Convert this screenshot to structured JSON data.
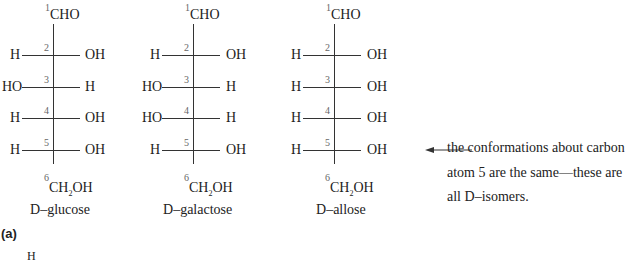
{
  "figure": {
    "panel_label": "(a)",
    "partial_next_label": "H",
    "structures": [
      {
        "name_prefix": "D",
        "name_suffix": "–glucose",
        "top": "CHO",
        "bottom_pre": "CH",
        "bottom_sub": "2",
        "bottom_post": "OH",
        "carbons": [
          {
            "num": "1"
          },
          {
            "num": "2",
            "left": "H",
            "right": "OH"
          },
          {
            "num": "3",
            "left": "HO",
            "right": "H"
          },
          {
            "num": "4",
            "left": "H",
            "right": "OH"
          },
          {
            "num": "5",
            "left": "H",
            "right": "OH"
          },
          {
            "num": "6"
          }
        ]
      },
      {
        "name_prefix": "D",
        "name_suffix": "–galactose",
        "top": "CHO",
        "bottom_pre": "CH",
        "bottom_sub": "2",
        "bottom_post": "OH",
        "carbons": [
          {
            "num": "1"
          },
          {
            "num": "2",
            "left": "H",
            "right": "OH"
          },
          {
            "num": "3",
            "left": "HO",
            "right": "H"
          },
          {
            "num": "4",
            "left": "HO",
            "right": "H"
          },
          {
            "num": "5",
            "left": "H",
            "right": "OH"
          },
          {
            "num": "6"
          }
        ]
      },
      {
        "name_prefix": "D",
        "name_suffix": "–allose",
        "top": "CHO",
        "bottom_pre": "CH",
        "bottom_sub": "2",
        "bottom_post": "OH",
        "carbons": [
          {
            "num": "1"
          },
          {
            "num": "2",
            "left": "H",
            "right": "OH"
          },
          {
            "num": "3",
            "left": "H",
            "right": "OH"
          },
          {
            "num": "4",
            "left": "H",
            "right": "OH"
          },
          {
            "num": "5",
            "left": "H",
            "right": "OH"
          },
          {
            "num": "6"
          }
        ]
      }
    ],
    "annotation": {
      "line1": "the conformations about carbon",
      "line2": "atom 5 are the same—these are",
      "line3_pre": "all ",
      "line3_sc": "D",
      "line3_post": "–isomers."
    }
  }
}
